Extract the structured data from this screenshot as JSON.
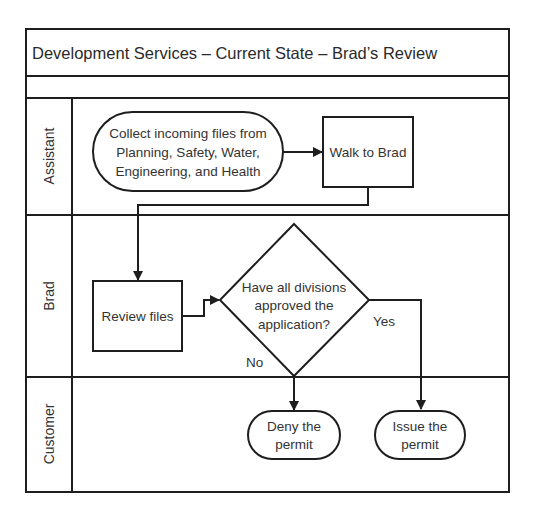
{
  "title": "Development Services – Current State – Brad’s Review",
  "lanes": [
    {
      "label": "Assistant"
    },
    {
      "label": "Brad"
    },
    {
      "label": "Customer"
    }
  ],
  "nodes": {
    "collect": {
      "type": "terminator",
      "lines": [
        "Collect incoming files from",
        "Planning, Safety, Water,",
        "Engineering, and Health"
      ]
    },
    "walk": {
      "type": "process",
      "lines": [
        "Walk to Brad"
      ]
    },
    "review": {
      "type": "process",
      "lines": [
        "Review files"
      ]
    },
    "decision": {
      "type": "decision",
      "lines": [
        "Have all divisions",
        "approved the",
        "application?"
      ]
    },
    "deny": {
      "type": "terminator",
      "lines": [
        "Deny the",
        "permit"
      ]
    },
    "issue": {
      "type": "terminator",
      "lines": [
        "Issue the",
        "permit"
      ]
    }
  },
  "edges": {
    "no_label": "No",
    "yes_label": "Yes"
  },
  "colors": {
    "line": "#1e1e1e",
    "text": "#333333",
    "background": "#ffffff"
  }
}
